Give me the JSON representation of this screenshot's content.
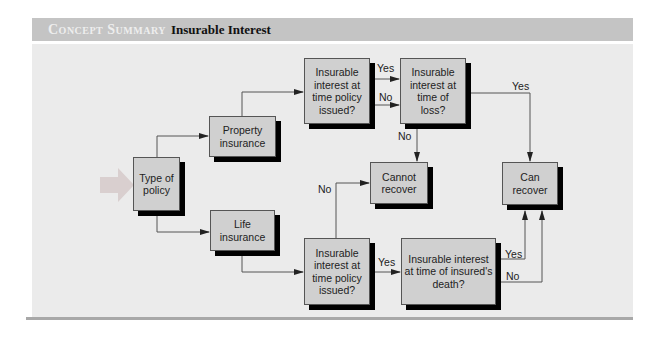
{
  "header": {
    "label": "Concept Summary",
    "title": "Insurable Interest"
  },
  "nodes": {
    "type": "Type of policy",
    "property": "Property insurance",
    "life": "Life insurance",
    "prop_issued": "Insurable interest at time policy issued?",
    "prop_loss": "Insurable interest at time of loss?",
    "cannot": "Cannot recover",
    "can": "Can recover",
    "life_issued": "Insurable interest at time policy issued?",
    "life_death": "Insurable interest at time of insured's death?"
  },
  "edges": {
    "prop_yes": "Yes",
    "prop_no": "No",
    "loss_yes": "Yes",
    "loss_no": "No",
    "life_no": "No",
    "life_yes": "Yes",
    "death_yes": "Yes",
    "death_no": "No"
  },
  "colors": {
    "header_bg": "#c4c4c4",
    "panel_bg": "#ebebeb",
    "box_fill": "#d0d0d0",
    "shadow": "#000000"
  }
}
